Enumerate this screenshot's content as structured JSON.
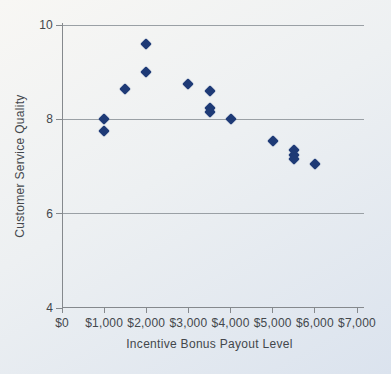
{
  "page": {
    "background_top_color": "#f8f7f4",
    "background_bottom_color": "#dbe3ee",
    "axis_color": "#85898d",
    "text_color": "#43474c"
  },
  "chart_data": {
    "type": "scatter",
    "title": "",
    "xlabel": "Incentive Bonus Payout Level",
    "ylabel": "Customer Service Quality",
    "xlim": [
      0,
      7000
    ],
    "ylim": [
      4,
      10
    ],
    "grid": "horizontal-only",
    "legend": "none",
    "x_ticks": [
      {
        "value": 0,
        "label": "$0"
      },
      {
        "value": 1000,
        "label": "$1,000"
      },
      {
        "value": 2000,
        "label": "$2,000"
      },
      {
        "value": 3000,
        "label": "$3,000"
      },
      {
        "value": 4000,
        "label": "$4,000"
      },
      {
        "value": 5000,
        "label": "$5,000"
      },
      {
        "value": 6000,
        "label": "$6,000"
      },
      {
        "value": 7000,
        "label": "$7,000"
      }
    ],
    "y_ticks": [
      {
        "value": 10,
        "label": "10"
      },
      {
        "value": 8,
        "label": "8"
      },
      {
        "value": 6,
        "label": "6"
      },
      {
        "value": 4,
        "label": "4"
      }
    ],
    "gridlines_y": [
      6,
      8,
      10
    ],
    "marker": {
      "shape": "diamond",
      "color": "#1e3a76",
      "size_px": 11
    },
    "points": [
      {
        "x": 1000,
        "y": 8.0
      },
      {
        "x": 1000,
        "y": 7.75
      },
      {
        "x": 1500,
        "y": 8.65
      },
      {
        "x": 2000,
        "y": 9.6
      },
      {
        "x": 2000,
        "y": 9.0
      },
      {
        "x": 3000,
        "y": 8.75
      },
      {
        "x": 3500,
        "y": 8.6
      },
      {
        "x": 3500,
        "y": 8.25
      },
      {
        "x": 3500,
        "y": 8.15
      },
      {
        "x": 4000,
        "y": 8.0
      },
      {
        "x": 5000,
        "y": 7.55
      },
      {
        "x": 5500,
        "y": 7.35
      },
      {
        "x": 5500,
        "y": 7.25
      },
      {
        "x": 5500,
        "y": 7.15
      },
      {
        "x": 6000,
        "y": 7.05
      }
    ]
  }
}
